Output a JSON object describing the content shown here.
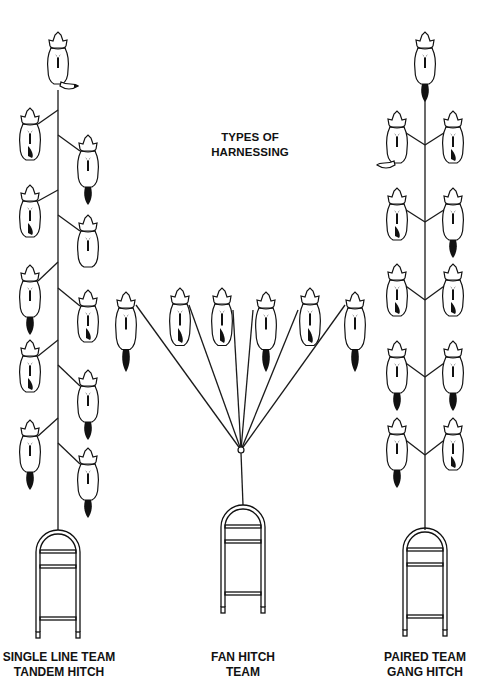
{
  "title": {
    "line1": "TYPES OF",
    "line2": "HARNESSING"
  },
  "captions": [
    {
      "id": "single",
      "line1": "SINGLE LINE TEAM",
      "line2": "TANDEM HITCH",
      "center_x": 60
    },
    {
      "id": "fan",
      "line1": "FAN HITCH",
      "line2": "TEAM",
      "center_x": 243
    },
    {
      "id": "paired",
      "line1": "PAIRED TEAM",
      "line2": "GANG HITCH",
      "center_x": 425
    }
  ],
  "diagram": {
    "ink_color": "#111111",
    "background": "#ffffff",
    "single_line": {
      "gangline_x": 58,
      "gangline_top": 90,
      "gangline_bottom": 530,
      "lead_dog": {
        "x": 58,
        "y": 62,
        "tail": "right"
      },
      "dogs": [
        {
          "side": "left",
          "x": 30,
          "y": 138,
          "attach_y": 110
        },
        {
          "side": "right",
          "x": 88,
          "y": 165,
          "attach_y": 135
        },
        {
          "side": "left",
          "x": 30,
          "y": 215,
          "attach_y": 190
        },
        {
          "side": "right",
          "x": 88,
          "y": 245,
          "attach_y": 215
        },
        {
          "side": "left",
          "x": 30,
          "y": 295,
          "attach_y": 262
        },
        {
          "side": "right",
          "x": 88,
          "y": 320,
          "attach_y": 288
        },
        {
          "side": "left",
          "x": 30,
          "y": 370,
          "attach_y": 340
        },
        {
          "side": "right",
          "x": 88,
          "y": 400,
          "attach_y": 365
        },
        {
          "side": "left",
          "x": 30,
          "y": 450,
          "attach_y": 418
        },
        {
          "side": "right",
          "x": 88,
          "y": 478,
          "attach_y": 443
        }
      ],
      "sled": {
        "x": 58,
        "top": 530
      }
    },
    "fan_hitch": {
      "hub": {
        "x": 241,
        "y": 450
      },
      "dogs": [
        {
          "x": 126,
          "y": 322,
          "attach": [
            136,
            305
          ]
        },
        {
          "x": 180,
          "y": 318,
          "attach": [
            189,
            305
          ]
        },
        {
          "x": 222,
          "y": 318,
          "attach": [
            233,
            310
          ]
        },
        {
          "x": 266,
          "y": 322,
          "attach": [
            253,
            310
          ]
        },
        {
          "x": 310,
          "y": 318,
          "attach": [
            298,
            310
          ]
        },
        {
          "x": 355,
          "y": 322,
          "attach": [
            345,
            305
          ]
        }
      ],
      "sled": {
        "x": 243,
        "top": 505
      }
    },
    "paired": {
      "gangline_x": 425,
      "gangline_top": 95,
      "gangline_bottom": 530,
      "lead_dog": {
        "x": 425,
        "y": 62,
        "tail": "down"
      },
      "pairs": [
        {
          "y": 145,
          "junction_y": 145
        },
        {
          "y": 222,
          "junction_y": 222
        },
        {
          "y": 298,
          "junction_y": 300
        },
        {
          "y": 375,
          "junction_y": 377
        },
        {
          "y": 452,
          "junction_y": 455
        }
      ],
      "sled": {
        "x": 425,
        "top": 528
      }
    }
  }
}
